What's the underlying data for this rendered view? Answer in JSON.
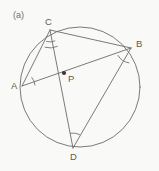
{
  "figure": {
    "panel_tag": "(a)",
    "background_color": "#f9f9f7",
    "stroke_color": "#6b6b6b",
    "label_color": "#5a5a5a",
    "width": 159,
    "height": 171
  },
  "circle": {
    "name": "circumscribed-circle",
    "center_x": 80,
    "center_y": 87,
    "radius": 60
  },
  "points": [
    {
      "id": "A",
      "label": "A",
      "x": 22,
      "y": 86,
      "label_x": 11,
      "label_y": 81,
      "marked": false
    },
    {
      "id": "B",
      "label": "B",
      "x": 131,
      "y": 48,
      "label_x": 136,
      "label_y": 39,
      "marked": false
    },
    {
      "id": "C",
      "label": "C",
      "x": 50,
      "y": 30,
      "label_x": 45,
      "label_y": 17,
      "marked": false
    },
    {
      "id": "D",
      "label": "D",
      "x": 73,
      "y": 148,
      "label_x": 70,
      "label_y": 152,
      "marked": false
    },
    {
      "id": "P",
      "label": "P",
      "x": 64,
      "y": 73,
      "label_x": 68,
      "label_y": 74,
      "marked": true
    }
  ],
  "chords": [
    {
      "id": "CB",
      "from": "C",
      "to": "B",
      "name": "chord-c-b"
    },
    {
      "id": "CA",
      "from": "C",
      "to": "A",
      "name": "chord-c-a"
    },
    {
      "id": "CD",
      "from": "C",
      "to": "D",
      "name": "chord-c-d"
    },
    {
      "id": "AB",
      "from": "A",
      "to": "B",
      "name": "chord-a-b"
    },
    {
      "id": "BD",
      "from": "B",
      "to": "D",
      "name": "chord-b-d"
    }
  ],
  "angle_arcs": [
    {
      "id": "angle-c-outer",
      "vertex": "C",
      "radius": 18,
      "start_deg": 66,
      "end_deg": 106
    },
    {
      "id": "angle-c-inner",
      "vertex": "C",
      "radius": 12,
      "start_deg": 66,
      "end_deg": 106
    },
    {
      "id": "angle-a",
      "vertex": "A",
      "radius": 13,
      "start_deg": -41,
      "end_deg": -4
    },
    {
      "id": "angle-b",
      "vertex": "B",
      "radius": 15,
      "start_deg": 98,
      "end_deg": 150
    },
    {
      "id": "angle-d",
      "vertex": "D",
      "radius": 15,
      "start_deg": -99,
      "end_deg": -64
    }
  ]
}
